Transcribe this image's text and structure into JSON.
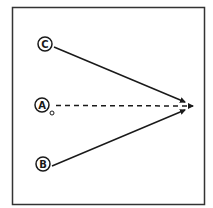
{
  "diagram": {
    "nodes": [
      {
        "id": "C",
        "label": "C",
        "cx": 45,
        "cy": 44
      },
      {
        "id": "A",
        "label": "A",
        "cx": 42,
        "cy": 105
      },
      {
        "id": "B",
        "label": "B",
        "cx": 43,
        "cy": 164
      }
    ],
    "edges": [
      {
        "from": "C",
        "to": "target",
        "style": "solid"
      },
      {
        "from": "A",
        "to": "target",
        "style": "dashed"
      },
      {
        "from": "B",
        "to": "target",
        "style": "solid"
      }
    ],
    "colors": {
      "stroke": "#1a1a1a",
      "background": "#ffffff"
    }
  }
}
